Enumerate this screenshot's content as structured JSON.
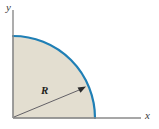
{
  "figure": {
    "background_color": "#ffffff",
    "axes": {
      "color": "#8a8a8a",
      "x_label": "x",
      "y_label": "y",
      "origin": {
        "x": 13,
        "y": 118
      },
      "x_axis_end": {
        "x": 141,
        "y": 118
      },
      "y_axis_end": {
        "x": 13,
        "y": 10
      }
    },
    "shape": {
      "kind": "quarter-circle-sector",
      "fill_color": "#e3ded0",
      "arc_color": "#1f7fb5",
      "arc_width_px": 2.2,
      "radius_px": 82,
      "arc_start": {
        "x": 13,
        "y": 36
      },
      "arc_end": {
        "x": 95,
        "y": 118
      },
      "edge_color": "#8a8a8a"
    },
    "radius_annotation": {
      "label": "R",
      "line_color": "#55525a",
      "arrow_from": {
        "x": 13,
        "y": 118
      },
      "arrow_to": {
        "x": 85,
        "y": 87
      },
      "arrowhead_color": "#2b2b2b"
    }
  }
}
